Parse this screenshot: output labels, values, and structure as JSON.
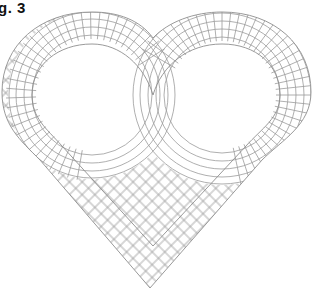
{
  "figure": {
    "label": "g. 3",
    "colors": {
      "background": "#ffffff",
      "tile_line": "#9a9a9a",
      "label": "#111111"
    },
    "tile_rows": 4
  }
}
